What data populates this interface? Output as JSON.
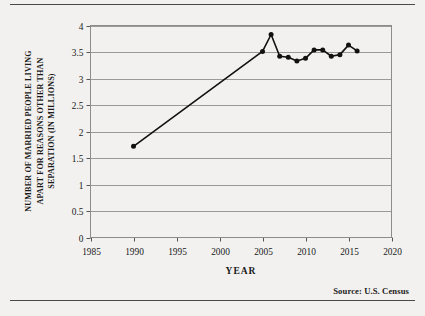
{
  "figure": {
    "source_note": "Source:  U.S. Census",
    "background_color": "#f2f1ef",
    "line_color": "#111111",
    "grid_color": "#9a9a9a"
  },
  "chart_data": {
    "type": "line",
    "title": "",
    "xlabel": "YEAR",
    "ylabel": "NUMBER OF MARRIED PEOPLE LIVING APART FOR REASONS OTHER THAN SEPARATION (IN MILLIONS)",
    "ylabel_lines": [
      "NUMBER OF MARRIED PEOPLE LIVING",
      "APART FOR REASONS OTHER THAN",
      "SEPARATION (IN MILLIONS)"
    ],
    "xlim": [
      1985,
      2020
    ],
    "ylim": [
      0,
      4
    ],
    "xticks": [
      1985,
      1990,
      1995,
      2000,
      2005,
      2010,
      2015,
      2020
    ],
    "xtick_labels": [
      "1985",
      "1990",
      "1995",
      "2000",
      "2005",
      "2010",
      "2015",
      "2020"
    ],
    "yticks": [
      0,
      0.5,
      1,
      1.5,
      2,
      2.5,
      3,
      3.5,
      4
    ],
    "ytick_labels": [
      "0",
      "0.5",
      "1",
      "1.5",
      "2",
      "2.5",
      "3",
      "3.5",
      "4"
    ],
    "grid": "horizontal",
    "legend": "none",
    "markers": "filled-circle",
    "x": [
      1990,
      2005,
      2006,
      2007,
      2008,
      2009,
      2010,
      2011,
      2012,
      2013,
      2014,
      2015,
      2016
    ],
    "values": [
      1.72,
      3.51,
      3.83,
      3.42,
      3.4,
      3.33,
      3.38,
      3.54,
      3.54,
      3.42,
      3.45,
      3.63,
      3.52
    ],
    "series": [
      {
        "name": "Married people living apart for reasons other than separation",
        "points": [
          {
            "x": 1990,
            "y": 1.72
          },
          {
            "x": 2005,
            "y": 3.51
          },
          {
            "x": 2006,
            "y": 3.83
          },
          {
            "x": 2007,
            "y": 3.42
          },
          {
            "x": 2008,
            "y": 3.4
          },
          {
            "x": 2009,
            "y": 3.33
          },
          {
            "x": 2010,
            "y": 3.38
          },
          {
            "x": 2011,
            "y": 3.54
          },
          {
            "x": 2012,
            "y": 3.54
          },
          {
            "x": 2013,
            "y": 3.42
          },
          {
            "x": 2014,
            "y": 3.45
          },
          {
            "x": 2015,
            "y": 3.63
          },
          {
            "x": 2016,
            "y": 3.52
          }
        ]
      }
    ]
  }
}
